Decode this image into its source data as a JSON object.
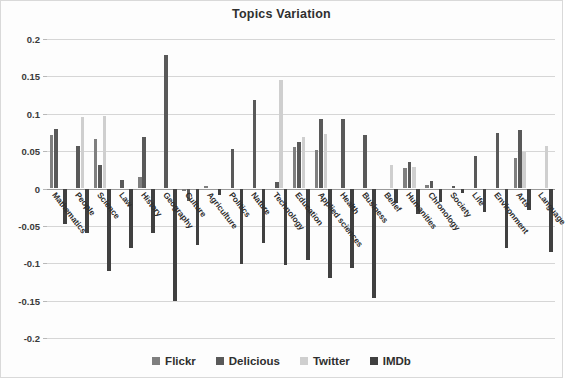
{
  "chart_data": {
    "type": "bar",
    "title": "Topics Variation",
    "xlabel": "",
    "ylabel": "",
    "ylim": [
      -0.2,
      0.2
    ],
    "ytick_step": 0.05,
    "yticks": [
      "0.2",
      "0.15",
      "0.1",
      "0.05",
      "0",
      "-0.05",
      "-0.1",
      "-0.15",
      "-0.2"
    ],
    "grid": true,
    "legend_position": "bottom",
    "categories": [
      "Mathematics",
      "People",
      "Science",
      "Law",
      "History",
      "Geography",
      "Culture",
      "Agriculture",
      "Politics",
      "Nature",
      "Technology",
      "Education",
      "Applied sciences",
      "Health",
      "Business",
      "Belief",
      "Humanities",
      "Chronology",
      "Society",
      "Life",
      "Environment",
      "Arts",
      "Language"
    ],
    "series": [
      {
        "name": "Flickr",
        "color": "#7f7f7f",
        "values": [
          0.071,
          0.0,
          0.066,
          0.0,
          0.016,
          0.0,
          -0.003,
          0.004,
          0.0,
          0.0,
          0.0,
          0.056,
          0.052,
          0.0,
          0.0,
          0.0,
          0.027,
          0.005,
          0.0,
          0.0,
          0.0,
          0.041,
          0.0
        ]
      },
      {
        "name": "Delicious",
        "color": "#595959",
        "values": [
          0.079,
          0.057,
          0.031,
          0.011,
          0.069,
          0.178,
          -0.017,
          0.0,
          0.053,
          0.119,
          0.009,
          0.062,
          0.093,
          0.093,
          0.072,
          0.0,
          0.036,
          0.01,
          0.003,
          0.044,
          0.074,
          0.078,
          0.0
        ]
      },
      {
        "name": "Twitter",
        "color": "#cfcfcf",
        "values": [
          0.0,
          0.095,
          0.097,
          0.0,
          0.0,
          0.0,
          0.0,
          0.0,
          0.0,
          0.0,
          0.145,
          0.069,
          0.073,
          0.0,
          0.0,
          0.031,
          0.029,
          0.0,
          0.0,
          0.0,
          0.0,
          0.049,
          0.057
        ]
      },
      {
        "name": "IMDb",
        "color": "#404040",
        "values": [
          -0.047,
          -0.06,
          -0.11,
          -0.079,
          -0.06,
          -0.151,
          -0.075,
          -0.009,
          -0.101,
          -0.073,
          -0.103,
          -0.095,
          -0.12,
          -0.107,
          -0.146,
          -0.02,
          -0.034,
          -0.018,
          -0.006,
          -0.031,
          -0.08,
          -0.029,
          -0.085
        ]
      }
    ]
  },
  "legend": {
    "items": [
      {
        "label": "Flickr",
        "color": "#7f7f7f"
      },
      {
        "label": "Delicious",
        "color": "#595959"
      },
      {
        "label": "Twitter",
        "color": "#cfcfcf"
      },
      {
        "label": "IMDb",
        "color": "#404040"
      }
    ]
  }
}
